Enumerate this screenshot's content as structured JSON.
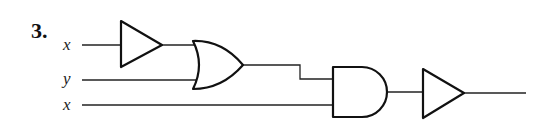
{
  "problem": {
    "number": "3."
  },
  "inputs": [
    {
      "label": "x",
      "y": 45
    },
    {
      "label": "y",
      "y": 80
    },
    {
      "label": "x",
      "y": 105
    }
  ],
  "gates": [
    {
      "id": "buffer-1",
      "type": "buffer",
      "input": "x"
    },
    {
      "id": "or-1",
      "type": "or",
      "inputs": [
        "buffer-1",
        "y"
      ]
    },
    {
      "id": "and-1",
      "type": "and",
      "inputs": [
        "or-1",
        "x"
      ]
    },
    {
      "id": "buffer-2",
      "type": "buffer",
      "input": "and-1"
    }
  ],
  "colors": {
    "stroke": "#111111",
    "background": "#ffffff"
  }
}
